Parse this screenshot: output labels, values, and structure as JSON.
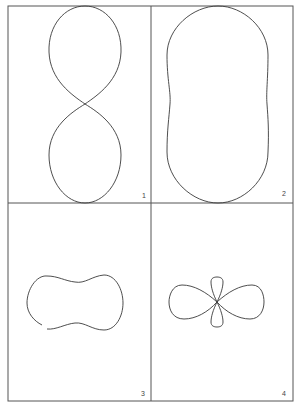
{
  "figure": {
    "type": "polar-pattern-grid",
    "layout": "2x2",
    "colors": {
      "background": "#ffffff",
      "frame": "#555555",
      "curve": "#3a3a3a"
    },
    "panels": [
      {
        "label": "1",
        "shape": "figure-eight (two vertically stacked egg-shaped lobes touching at center)"
      },
      {
        "label": "2",
        "shape": "tall peanut / dumbbell outline with slight waist"
      },
      {
        "label": "3",
        "shape": "horizontal peanut outline with shallow dips top and bottom"
      },
      {
        "label": "4",
        "shape": "four-lobed pattern: two large horizontal lobes and two small vertical lobes"
      }
    ]
  }
}
